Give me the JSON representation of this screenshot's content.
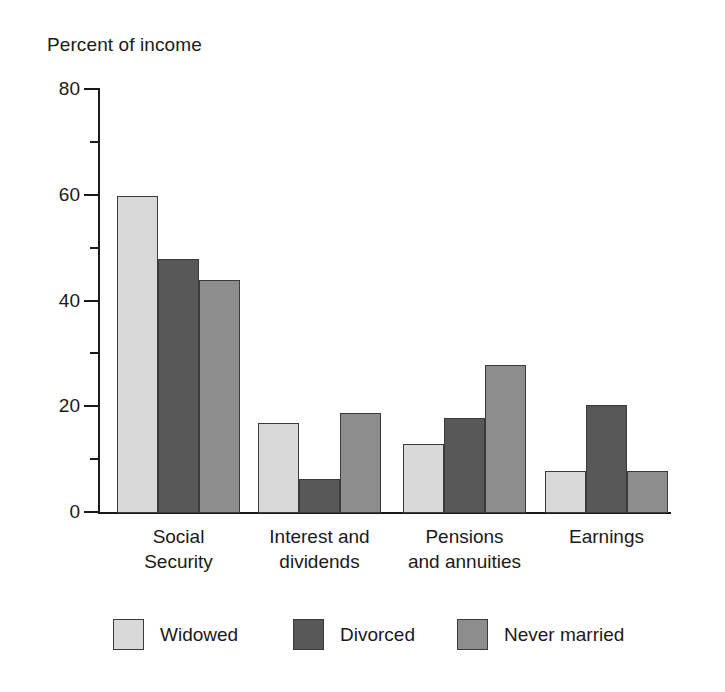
{
  "chart_data": {
    "type": "bar",
    "title": "Percent of income",
    "xlabel": "",
    "ylabel": "Percent of income",
    "ylim": [
      0,
      80
    ],
    "ytick_major": [
      0,
      20,
      40,
      60,
      80
    ],
    "ytick_minor": [
      10,
      30,
      50,
      70
    ],
    "grid": false,
    "legend_position": "bottom",
    "categories": [
      "Social\nSecurity",
      "Interest and\ndividends",
      "Pensions\nand annuities",
      "Earnings"
    ],
    "series": [
      {
        "name": "Widowed",
        "color": "#d9d9d9",
        "values": [
          60,
          17,
          13,
          8
        ]
      },
      {
        "name": "Divorced",
        "color": "#585858",
        "values": [
          48,
          6.5,
          18,
          20.4
        ]
      },
      {
        "name": "Never married",
        "color": "#8d8d8d",
        "values": [
          44,
          19,
          28,
          8
        ]
      }
    ]
  },
  "axis": {
    "title": "Percent of income",
    "ytick_labels": [
      "80",
      "60",
      "40",
      "20",
      "0"
    ]
  },
  "legend": {
    "items": [
      {
        "label": "Widowed"
      },
      {
        "label": "Divorced"
      },
      {
        "label": "Never married"
      }
    ]
  }
}
